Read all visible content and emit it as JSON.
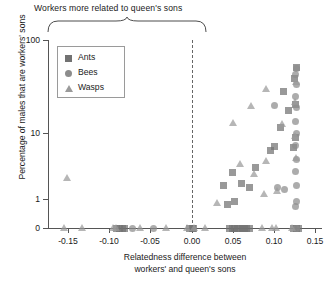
{
  "annotation": {
    "top_bracket_label": "Workers more related to queen's sons"
  },
  "legend": {
    "position": "inside-top-left",
    "entries": [
      {
        "label": "Ants",
        "marker": "square-marker"
      },
      {
        "label": "Bees",
        "marker": "circle-marker"
      },
      {
        "label": "Wasps",
        "marker": "triangle-marker"
      }
    ]
  },
  "axes": {
    "y": {
      "label": "Percentage of males that are workers' sons",
      "ticks": [
        "100",
        "10",
        "1",
        "0"
      ],
      "scale": "log-with-zero"
    },
    "x": {
      "label_line1": "Relatedness difference between",
      "label_line2": "workers' and queen's sons",
      "ticks": [
        "-0.15",
        "-0.10",
        "-0.05",
        "0.00",
        "0.05",
        "0.10",
        "0.15"
      ],
      "reference_line": "0.00"
    }
  },
  "colors": {
    "ants": "#727272",
    "bees": "#8c8c8c",
    "wasps": "#9a9a9a",
    "axis": "#555555",
    "reference_line": "#666666"
  },
  "chart_data": {
    "type": "scatter",
    "title": "",
    "xlabel": "Relatedness difference between workers' and queen's sons",
    "ylabel": "Percentage of males that are workers' sons",
    "xlim": [
      -0.175,
      0.155
    ],
    "ylim_note": "log axis: 0 baseline, then 1, 10, 100",
    "yticks": [
      0,
      1,
      10,
      100
    ],
    "xticks": [
      -0.15,
      -0.1,
      -0.05,
      0.0,
      0.05,
      0.1,
      0.15
    ],
    "grid": false,
    "legend_position": "upper left inside",
    "reference_lines": [
      {
        "axis": "x",
        "value": 0.0,
        "style": "dashed"
      }
    ],
    "annotations": [
      {
        "text": "Workers more related to queen's sons",
        "type": "bracket",
        "x_range": [
          -0.165,
          0.0
        ]
      }
    ],
    "series": [
      {
        "name": "Ants",
        "marker": "square",
        "color": "#727272",
        "points": [
          [
            -0.092,
            0
          ],
          [
            -0.088,
            0
          ],
          [
            -0.085,
            0
          ],
          [
            -0.082,
            0
          ],
          [
            -0.003,
            0
          ],
          [
            0.0,
            0
          ],
          [
            0.002,
            0
          ],
          [
            0.046,
            0
          ],
          [
            0.049,
            0
          ],
          [
            0.052,
            0
          ],
          [
            0.055,
            0
          ],
          [
            0.058,
            0
          ],
          [
            0.061,
            0
          ],
          [
            0.064,
            0
          ],
          [
            0.067,
            0
          ],
          [
            0.07,
            0
          ],
          [
            0.124,
            0
          ],
          [
            0.127,
            0
          ],
          [
            0.13,
            0
          ],
          [
            0.043,
            0.8
          ],
          [
            0.052,
            0.9
          ],
          [
            0.038,
            1.6
          ],
          [
            0.06,
            1.7
          ],
          [
            0.07,
            1.5
          ],
          [
            0.049,
            2.5
          ],
          [
            0.078,
            3.0
          ],
          [
            0.096,
            5.5
          ],
          [
            0.101,
            6.2
          ],
          [
            0.124,
            6.0
          ],
          [
            0.126,
            8.5
          ],
          [
            0.108,
            12.0
          ],
          [
            0.118,
            22.0
          ],
          [
            0.126,
            27.0
          ],
          [
            0.112,
            42.0
          ],
          [
            0.125,
            68.0
          ],
          [
            0.127,
            100.0
          ]
        ]
      },
      {
        "name": "Bees",
        "marker": "circle",
        "color": "#8c8c8c",
        "points": [
          [
            -0.072,
            0
          ],
          [
            -0.047,
            0
          ],
          [
            0.128,
            0
          ],
          [
            0.126,
            0.75
          ],
          [
            0.128,
            0.9
          ],
          [
            0.104,
            1.5
          ],
          [
            0.113,
            1.4
          ],
          [
            0.127,
            1.6
          ],
          [
            0.126,
            2.6
          ],
          [
            0.127,
            4.0
          ],
          [
            0.126,
            6.5
          ],
          [
            0.127,
            10.0
          ],
          [
            0.126,
            15.0
          ],
          [
            0.1,
            26.0
          ],
          [
            0.127,
            24.0
          ],
          [
            0.126,
            36.0
          ],
          [
            0.127,
            55.0
          ],
          [
            0.126,
            78.0
          ],
          [
            0.128,
            95.0
          ]
        ]
      },
      {
        "name": "Wasps",
        "marker": "triangle",
        "color": "#9a9a9a",
        "points": [
          [
            -0.156,
            0
          ],
          [
            -0.134,
            0
          ],
          [
            -0.096,
            0
          ],
          [
            -0.093,
            0
          ],
          [
            -0.064,
            0
          ],
          [
            -0.032,
            0
          ],
          [
            -0.006,
            0
          ],
          [
            0.003,
            0
          ],
          [
            0.016,
            0
          ],
          [
            0.085,
            0
          ],
          [
            0.098,
            0
          ],
          [
            0.102,
            0
          ],
          [
            0.122,
            0
          ],
          [
            -0.152,
            2.1
          ],
          [
            0.03,
            0.85
          ],
          [
            0.088,
            1.2
          ],
          [
            0.104,
            1.3
          ],
          [
            0.075,
            2.4
          ],
          [
            0.058,
            3.4
          ],
          [
            0.09,
            3.8
          ],
          [
            0.127,
            4.2
          ],
          [
            0.126,
            9.0
          ],
          [
            0.11,
            13.5
          ],
          [
            0.05,
            14.0
          ],
          [
            0.072,
            26.0
          ],
          [
            0.126,
            30.0
          ],
          [
            0.09,
            46.0
          ],
          [
            0.127,
            60.0
          ]
        ]
      }
    ]
  }
}
